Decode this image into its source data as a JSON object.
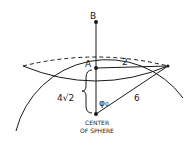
{
  "diagram": {
    "labels": {
      "point_b": "B",
      "point_a": "A",
      "radius_small": "2",
      "radius_sphere": "6",
      "height": "4√2",
      "angle": "φ₀",
      "center_line1": "CENTER",
      "center_line2": "OF SPHERE"
    },
    "colors": {
      "stroke": "#1a1a1a",
      "background": "#ffffff"
    }
  }
}
